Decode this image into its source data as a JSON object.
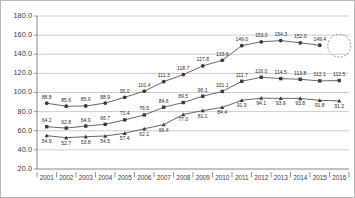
{
  "chart_data": {
    "type": "line",
    "title": "",
    "subtitle": "",
    "xlabel": "",
    "ylabel": "",
    "ylim": [
      20.0,
      180.0
    ],
    "ytick_step": 20.0,
    "yticks": [
      "20.0",
      "40.0",
      "60.0",
      "80.0",
      "100.0",
      "120.0",
      "140.0",
      "160.0",
      "180.0"
    ],
    "grid": true,
    "legend": "none",
    "categories": [
      "2001",
      "2002",
      "2003",
      "2004",
      "2005",
      "2006",
      "2007",
      "2008",
      "2009",
      "2010",
      "2011",
      "2012",
      "2013",
      "2014",
      "2015",
      "2016"
    ],
    "series": [
      {
        "name": "series-1",
        "marker": "circle",
        "color": "#3a3a3a",
        "values": [
          88.8,
          85.6,
          85.9,
          88.9,
          95.0,
          101.4,
          111.3,
          118.7,
          127.8,
          133.6,
          149.0,
          153.0,
          154.3,
          152.0,
          149.4,
          null
        ],
        "labels": [
          "88.8",
          "85.6",
          "85.9",
          "88.9",
          "95.0",
          "101.4",
          "111.3",
          "118.7",
          "127.8",
          "133.6",
          "149.0",
          "153.0",
          "154.3",
          "152.0",
          "149.4",
          ""
        ]
      },
      {
        "name": "series-2",
        "marker": "square",
        "color": "#3a3a3a",
        "values": [
          64.2,
          62.8,
          64.9,
          66.7,
          71.4,
          76.5,
          84.6,
          89.5,
          96.1,
          101.1,
          111.7,
          116.0,
          114.5,
          113.8,
          112.1,
          112.5
        ],
        "labels": [
          "64.2",
          "62.8",
          "64.9",
          "66.7",
          "71.4",
          "76.5",
          "84.6",
          "89.5",
          "96.1",
          "101.1",
          "111.7",
          "116.0",
          "114.5",
          "113.8",
          "112.1",
          "112.5"
        ]
      },
      {
        "name": "series-3",
        "marker": "triangle",
        "color": "#3a3a3a",
        "values": [
          54.9,
          52.7,
          53.8,
          54.5,
          57.4,
          62.1,
          66.4,
          77.0,
          81.1,
          84.4,
          91.9,
          94.1,
          93.9,
          93.8,
          91.8,
          91.2
        ],
        "labels": [
          "54.9",
          "52.7",
          "53.8",
          "54.5",
          "57.4",
          "62.1",
          "66.4",
          "77.0",
          "81.1",
          "84.4",
          "91.9",
          "94.1",
          "93.9",
          "93.8",
          "91.8",
          "91.2"
        ]
      }
    ],
    "annotations": [
      {
        "name": "highlight-circle",
        "shape": "dashed-circle",
        "at_year": "2016",
        "at_value": 149.0
      }
    ]
  }
}
